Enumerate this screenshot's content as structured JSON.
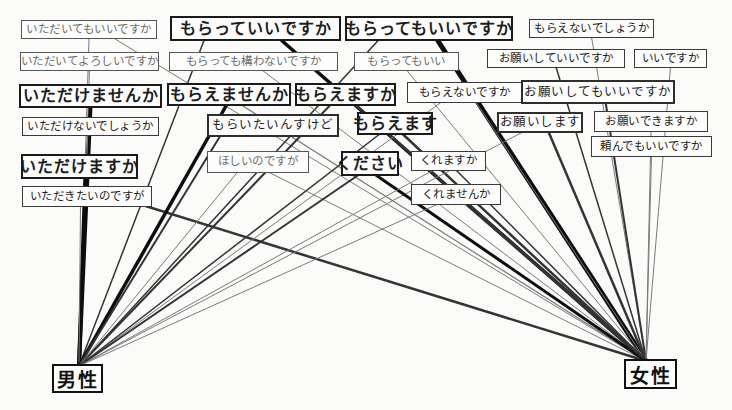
{
  "diagram": {
    "background": "#fbfbf9",
    "palette": {
      "edge_thick": "#0d0d0d",
      "edge_medium": "#343434",
      "edge_thin": "#7a7a7a",
      "box_border": "#1a1a1a"
    },
    "groups": [
      {
        "id": "male",
        "label": "男性",
        "x": 52,
        "y": 364,
        "w": 51,
        "h": 29,
        "anchor_x": 79,
        "anchor_y": 366
      },
      {
        "id": "female",
        "label": "女性",
        "x": 624,
        "y": 359,
        "w": 53,
        "h": 30,
        "anchor_x": 646,
        "anchor_y": 361
      }
    ],
    "phrases": [
      {
        "id": "itadaite_mo_ii",
        "text": "いただいてもいいですか",
        "x": 21,
        "y": 20,
        "w": 136,
        "h": 19,
        "style": "small",
        "muted": true
      },
      {
        "id": "moratte_ii",
        "text": "もらっていいですか",
        "x": 170,
        "y": 16,
        "w": 171,
        "h": 25,
        "style": "strong",
        "muted": false
      },
      {
        "id": "moratte_mo_ii_desuka",
        "text": "もらってもいいですか",
        "x": 345,
        "y": 16,
        "w": 168,
        "h": 25,
        "style": "strong",
        "muted": false
      },
      {
        "id": "moraenai_deshouka",
        "text": "もらえないでしょうか",
        "x": 529,
        "y": 19,
        "w": 125,
        "h": 19,
        "style": "small",
        "muted": false
      },
      {
        "id": "itadaite_yoroshii",
        "text": "いただいてよろしいですか",
        "x": 20,
        "y": 52,
        "w": 139,
        "h": 19,
        "style": "small",
        "muted": true
      },
      {
        "id": "kamawanai",
        "text": "もらっても構わないですか",
        "x": 169,
        "y": 52,
        "w": 169,
        "h": 19,
        "style": "small",
        "muted": true
      },
      {
        "id": "moratte_mo_ii",
        "text": "もらってもいい",
        "x": 354,
        "y": 52,
        "w": 105,
        "h": 19,
        "style": "small",
        "muted": true
      },
      {
        "id": "onegai_shite_ii",
        "text": "お願いしていいですか",
        "x": 487,
        "y": 49,
        "w": 138,
        "h": 19,
        "style": "small",
        "muted": false
      },
      {
        "id": "ii_desuka",
        "text": "いいですか",
        "x": 634,
        "y": 49,
        "w": 73,
        "h": 19,
        "style": "small",
        "muted": false
      },
      {
        "id": "itadakemasenka",
        "text": "いただけませんか",
        "x": 19,
        "y": 84,
        "w": 143,
        "h": 24,
        "style": "strong",
        "muted": false
      },
      {
        "id": "moraemasenka",
        "text": "もらえませんか",
        "x": 167,
        "y": 83,
        "w": 124,
        "h": 23,
        "style": "strong",
        "muted": false
      },
      {
        "id": "moraemasuka",
        "text": "もらえますか",
        "x": 295,
        "y": 83,
        "w": 101,
        "h": 23,
        "style": "strong",
        "muted": false
      },
      {
        "id": "moraenai_desuka",
        "text": "もらえないですか",
        "x": 407,
        "y": 82,
        "w": 115,
        "h": 21,
        "style": "small",
        "muted": false
      },
      {
        "id": "onegai_shitemo_ii",
        "text": "お願いしてもいいですか",
        "x": 521,
        "y": 80,
        "w": 154,
        "h": 24,
        "style": "medium",
        "muted": false
      },
      {
        "id": "itadakenai_deshouka",
        "text": "いただけないでしょうか",
        "x": 22,
        "y": 117,
        "w": 137,
        "h": 19,
        "style": "small",
        "muted": false
      },
      {
        "id": "moraitain_sukedo",
        "text": "もらいたいんすけど",
        "x": 207,
        "y": 114,
        "w": 132,
        "h": 23,
        "style": "medium",
        "muted": false
      },
      {
        "id": "moraemasu",
        "text": "もらえます",
        "x": 357,
        "y": 112,
        "w": 76,
        "h": 23,
        "style": "strong",
        "muted": false
      },
      {
        "id": "onegai_shimasu",
        "text": "お願いします",
        "x": 497,
        "y": 112,
        "w": 86,
        "h": 21,
        "style": "medium",
        "muted": false
      },
      {
        "id": "onegai_dekimasuka",
        "text": "お願いできますか",
        "x": 594,
        "y": 111,
        "w": 114,
        "h": 21,
        "style": "small",
        "muted": false
      },
      {
        "id": "tanondemo_ii",
        "text": "頼んでもいいですか",
        "x": 591,
        "y": 136,
        "w": 121,
        "h": 21,
        "style": "small",
        "muted": false
      },
      {
        "id": "itadakemasuka",
        "text": "いただけますか",
        "x": 21,
        "y": 154,
        "w": 117,
        "h": 25,
        "style": "strong",
        "muted": false
      },
      {
        "id": "hoshii_no_desuga",
        "text": "ほしいのですが",
        "x": 207,
        "y": 151,
        "w": 102,
        "h": 22,
        "style": "small",
        "muted": true
      },
      {
        "id": "kudasai",
        "text": "ください",
        "x": 341,
        "y": 151,
        "w": 58,
        "h": 25,
        "style": "strong",
        "muted": false
      },
      {
        "id": "kuremasuka",
        "text": "くれますか",
        "x": 411,
        "y": 151,
        "w": 75,
        "h": 20,
        "style": "small",
        "muted": false
      },
      {
        "id": "itadakitai_no_desuga",
        "text": "いただきたいのですが",
        "x": 22,
        "y": 186,
        "w": 130,
        "h": 21,
        "style": "small",
        "muted": false
      },
      {
        "id": "kuremasenka",
        "text": "くれませんか",
        "x": 411,
        "y": 184,
        "w": 90,
        "h": 21,
        "style": "small",
        "muted": false
      }
    ],
    "edges": [
      {
        "from": "itadaite_mo_ii",
        "to": "male",
        "weight": 1,
        "fx": 0.5
      },
      {
        "from": "itadaite_mo_ii",
        "to": "female",
        "weight": 1,
        "fx": 0.68
      },
      {
        "from": "itadaite_yoroshii",
        "to": "male",
        "weight": 1,
        "fx": 0.5
      },
      {
        "from": "itadakemasenka",
        "to": "male",
        "weight": 4,
        "fx": 0.5
      },
      {
        "from": "itadakenai_deshouka",
        "to": "male",
        "weight": 1,
        "fx": 0.48
      },
      {
        "from": "itadakemasuka",
        "to": "male",
        "weight": 4,
        "fx": 0.55
      },
      {
        "from": "itadakitai_no_desuga",
        "to": "male",
        "weight": 1,
        "fx": 0.45
      },
      {
        "from": "itadakitai_no_desuga",
        "to": "female",
        "weight": 2.5,
        "fx": 0.95
      },
      {
        "from": "moratte_ii",
        "to": "male",
        "weight": 1.5,
        "fx": 0.2
      },
      {
        "from": "moratte_ii",
        "to": "female",
        "weight": 3.5,
        "fx": 0.65
      },
      {
        "from": "moratte_mo_ii_desuka",
        "to": "male",
        "weight": 1.5,
        "fx": 0.2
      },
      {
        "from": "moratte_mo_ii_desuka",
        "to": "female",
        "weight": 5,
        "fx": 0.55
      },
      {
        "from": "moraenai_deshouka",
        "to": "female",
        "weight": 1,
        "fx": 0.5
      },
      {
        "from": "kamawanai",
        "to": "female",
        "weight": 1,
        "fx": 0.55
      },
      {
        "from": "moratte_mo_ii",
        "to": "female",
        "weight": 1,
        "fx": 0.5
      },
      {
        "from": "onegai_shite_ii",
        "to": "female",
        "weight": 1.5,
        "fx": 0.5
      },
      {
        "from": "ii_desuka",
        "to": "female",
        "weight": 1,
        "fx": 0.5
      },
      {
        "from": "moraemasenka",
        "to": "male",
        "weight": 3.5,
        "fx": 0.48
      },
      {
        "from": "moraemasenka",
        "to": "female",
        "weight": 1.2,
        "fx": 0.6
      },
      {
        "from": "moraemasuka",
        "to": "male",
        "weight": 2,
        "fx": 0.35
      },
      {
        "from": "moraemasuka",
        "to": "female",
        "weight": 2.5,
        "fx": 0.6
      },
      {
        "from": "moraenai_desuka",
        "to": "male",
        "weight": 1,
        "fx": 0.3
      },
      {
        "from": "moraenai_desuka",
        "to": "female",
        "weight": 1,
        "fx": 0.6
      },
      {
        "from": "onegai_shitemo_ii",
        "to": "female",
        "weight": 2,
        "fx": 0.55
      },
      {
        "from": "moraitain_sukedo",
        "to": "male",
        "weight": 2,
        "fx": 0.1
      },
      {
        "from": "moraemasu",
        "to": "male",
        "weight": 1.5,
        "fx": 0.3
      },
      {
        "from": "moraemasu",
        "to": "female",
        "weight": 2.5,
        "fx": 0.6
      },
      {
        "from": "onegai_shimasu",
        "to": "male",
        "weight": 1,
        "fx": 0.3
      },
      {
        "from": "onegai_shimasu",
        "to": "female",
        "weight": 2.5,
        "fx": 0.6
      },
      {
        "from": "onegai_dekimasuka",
        "to": "female",
        "weight": 1,
        "fx": 0.5
      },
      {
        "from": "tanondemo_ii",
        "to": "female",
        "weight": 1,
        "fx": 0.5
      },
      {
        "from": "hoshii_no_desuga",
        "to": "male",
        "weight": 1,
        "fx": 0.3
      },
      {
        "from": "hoshii_no_desuga",
        "to": "female",
        "weight": 1,
        "fx": 0.6
      },
      {
        "from": "kudasai",
        "to": "male",
        "weight": 2,
        "fx": 0.3
      },
      {
        "from": "kudasai",
        "to": "female",
        "weight": 3,
        "fx": 0.6
      },
      {
        "from": "kuremasuka",
        "to": "male",
        "weight": 1,
        "fx": 0.3
      },
      {
        "from": "kuremasuka",
        "to": "female",
        "weight": 1.5,
        "fx": 0.6
      },
      {
        "from": "kuremasenka",
        "to": "male",
        "weight": 1,
        "fx": 0.3
      },
      {
        "from": "kuremasenka",
        "to": "female",
        "weight": 1.5,
        "fx": 0.6
      }
    ]
  }
}
